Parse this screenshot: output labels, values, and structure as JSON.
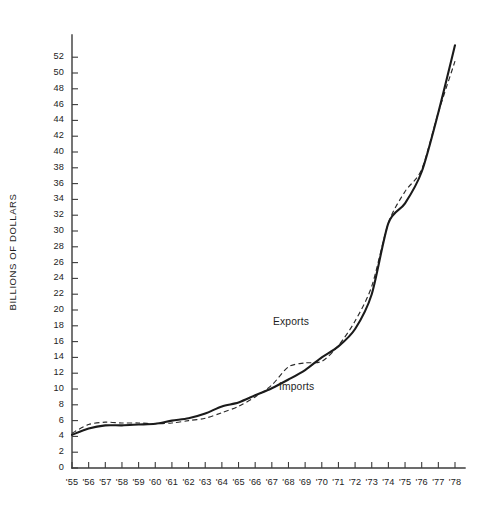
{
  "chart_data": {
    "type": "line",
    "title": "",
    "subtitle": "",
    "xlabel": "",
    "ylabel": "BILLIONS OF DOLLARS",
    "xlim": [
      1955,
      1978
    ],
    "ylim": [
      0,
      54
    ],
    "grid": false,
    "legend_position": "inline-annotations",
    "x": [
      1955,
      1956,
      1957,
      1958,
      1959,
      1960,
      1961,
      1962,
      1963,
      1964,
      1965,
      1966,
      1967,
      1968,
      1969,
      1970,
      1971,
      1972,
      1973,
      1974,
      1975,
      1976,
      1977,
      1978
    ],
    "x_tick_labels": [
      "'55",
      "'56",
      "'57",
      "'58",
      "'59",
      "'60",
      "'61",
      "'62",
      "'63",
      "'64",
      "'65",
      "'66",
      "'67",
      "'68",
      "'69",
      "'70",
      "'71",
      "'72",
      "'73",
      "'74",
      "'75",
      "'76",
      "'77",
      "'78"
    ],
    "y_tick_labels": [
      "0",
      "2",
      "4",
      "6",
      "8",
      "10",
      "12",
      "14",
      "16",
      "18",
      "20",
      "22",
      "24",
      "26",
      "28",
      "30",
      "32",
      "34",
      "36",
      "38",
      "40",
      "42",
      "44",
      "46",
      "48",
      "50",
      "52"
    ],
    "y_ticks": [
      0,
      2,
      4,
      6,
      8,
      10,
      12,
      14,
      16,
      18,
      20,
      22,
      24,
      26,
      28,
      30,
      32,
      34,
      36,
      38,
      40,
      42,
      44,
      46,
      48,
      50,
      52
    ],
    "series": [
      {
        "name": "Exports",
        "style": "solid",
        "color": "#1b1b1b",
        "values": [
          4.2,
          5.0,
          5.4,
          5.4,
          5.5,
          5.6,
          6.0,
          6.3,
          6.9,
          7.8,
          8.3,
          9.2,
          10.1,
          11.2,
          12.4,
          14.0,
          15.4,
          17.6,
          22.0,
          31.0,
          33.5,
          37.5,
          45.0,
          53.5
        ]
      },
      {
        "name": "Imports",
        "style": "dashed",
        "color": "#2a2a2a",
        "values": [
          4.4,
          5.5,
          5.8,
          5.7,
          5.7,
          5.6,
          5.7,
          6.0,
          6.3,
          7.0,
          7.8,
          9.0,
          10.5,
          12.8,
          13.3,
          13.5,
          15.5,
          18.6,
          23.0,
          31.0,
          35.0,
          37.8,
          45.0,
          51.5
        ]
      }
    ],
    "annotations": [
      {
        "text": "Exports",
        "series": "Exports"
      },
      {
        "text": "Imports",
        "series": "Imports"
      }
    ]
  },
  "geometry": {
    "plot_left": 72,
    "plot_right": 455,
    "plot_bottom": 468,
    "value_scale_px_per_unit": 7.9,
    "axis_top": 35
  }
}
